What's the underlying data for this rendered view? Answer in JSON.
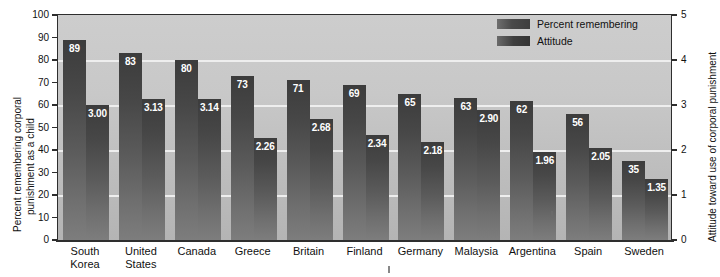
{
  "chart_data": {
    "type": "bar",
    "title": "",
    "categories": [
      "South Korea",
      "United States",
      "Canada",
      "Greece",
      "Britain",
      "Finland",
      "Germany",
      "Malaysia",
      "Argentina",
      "Spain",
      "Sweden"
    ],
    "series": [
      {
        "name": "Percent remembering",
        "axis": "left",
        "values": [
          89,
          83,
          80,
          73,
          71,
          69,
          65,
          63,
          62,
          56,
          35
        ],
        "labels": [
          "89",
          "83",
          "80",
          "73",
          "71",
          "69",
          "65",
          "63",
          "62",
          "56",
          "35"
        ]
      },
      {
        "name": "Attitude",
        "axis": "right",
        "values": [
          3.0,
          3.13,
          3.14,
          2.26,
          2.68,
          2.34,
          2.18,
          2.9,
          1.96,
          2.05,
          1.35
        ],
        "labels": [
          "3.00",
          "3.13",
          "3.14",
          "2.26",
          "2.68",
          "2.34",
          "2.18",
          "2.90",
          "1.96",
          "2.05",
          "1.35"
        ]
      }
    ],
    "ylabel": "Percent remembering corporal punishment as a child",
    "ylabel_right": "Attitude toward use of corporal punishment",
    "xlabel": "",
    "ylim": [
      0,
      100
    ],
    "ylim_right": [
      0,
      5
    ],
    "yticks": [
      "0",
      "10",
      "20",
      "30",
      "40",
      "50",
      "60",
      "70",
      "80",
      "90",
      "100"
    ],
    "yticks_right": [
      "0",
      "1",
      "2",
      "3",
      "4",
      "5"
    ],
    "gridlines_left": [
      20,
      40,
      60,
      80
    ],
    "grid": true,
    "legend_position": "top-right",
    "legend": [
      "Percent remembering",
      "Attitude"
    ]
  },
  "legend": {
    "items": [
      {
        "label": "Percent remembering",
        "swatch": "legend-swatch-percent"
      },
      {
        "label": "Attitude",
        "swatch": "legend-swatch-attitude"
      }
    ]
  },
  "axes": {
    "left_title": "Percent remembering corporal\npunishment as a child",
    "left_title_line1": "Percent remembering corporal",
    "left_title_line2": "punishment as a child",
    "right_title": "Attitude toward use of corporal punishment"
  },
  "colors": {
    "plot_background": "#c8c8c8",
    "bar_top": "#3c3c3c",
    "bar_bottom": "#7d7d7d",
    "gridline": "#eeeeee",
    "axis": "#2e2e2e",
    "value_text": "#ffffff",
    "label_text": "#111111",
    "page_background": "#ffffff"
  }
}
